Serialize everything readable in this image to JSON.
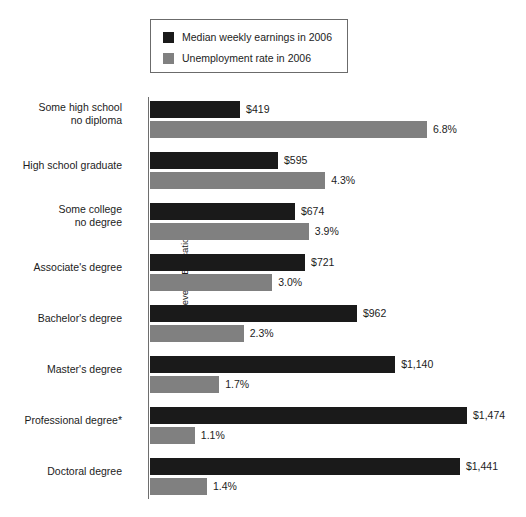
{
  "legend": {
    "items": [
      {
        "label": "Median weekly earnings in 2006",
        "color": "#1a1a1a",
        "key": "earnings"
      },
      {
        "label": "Unemployment rate in 2006",
        "color": "#808080",
        "key": "unemployment"
      }
    ]
  },
  "axis": {
    "y_title": "Level of Education"
  },
  "footnote_marker": "*",
  "chart_data": {
    "type": "bar",
    "orientation": "horizontal",
    "title": "",
    "xlabel": "",
    "ylabel": "Level of Education",
    "grid": false,
    "legend_position": "top-center",
    "categories": [
      "Some high school\nno diploma",
      "High school graduate",
      "Some college\nno degree",
      "Associate's degree",
      "Bachelor's degree",
      "Master's degree",
      "Professional degree*",
      "Doctoral degree"
    ],
    "category_lines": [
      [
        "Some high school",
        "no diploma"
      ],
      [
        "High school graduate"
      ],
      [
        "Some college",
        "no degree"
      ],
      [
        "Associate's degree"
      ],
      [
        "Bachelor's degree"
      ],
      [
        "Master's degree"
      ],
      [
        "Professional degree*"
      ],
      [
        "Doctoral degree"
      ]
    ],
    "series": [
      {
        "name": "Median weekly earnings in 2006",
        "color": "#1a1a1a",
        "unit": "USD per week",
        "values": [
          419,
          595,
          674,
          721,
          962,
          1140,
          1474,
          1441
        ],
        "labels": [
          "$419",
          "$595",
          "$674",
          "$721",
          "$962",
          "$1,140",
          "$1,474",
          "$1,441"
        ],
        "axis_max": 1474
      },
      {
        "name": "Unemployment rate in 2006",
        "color": "#808080",
        "unit": "percent",
        "values": [
          6.8,
          4.3,
          3.9,
          3.0,
          2.3,
          1.7,
          1.1,
          1.4
        ],
        "labels": [
          "6.8%",
          "4.3%",
          "3.9%",
          "3.0%",
          "2.3%",
          "1.7%",
          "1.1%",
          "1.4%"
        ],
        "axis_max": 6.8
      }
    ]
  }
}
